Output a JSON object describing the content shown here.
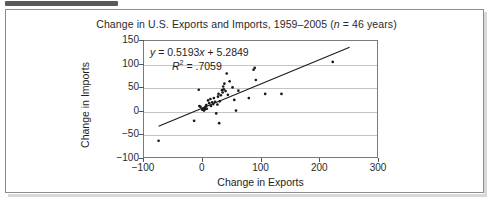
{
  "chart_data": {
    "type": "scatter",
    "title": "Change in U.S. Exports and Imports, 1959–2005 (n = 46 years)",
    "title_plain": "Change in U.S. Exports and Imports, 1959-2005 (n = 46 years)",
    "xlabel": "Change in Exports",
    "ylabel": "Change in Imports",
    "xlim": [
      -100,
      300
    ],
    "ylim": [
      -100,
      150
    ],
    "xticks": [
      -100,
      0,
      100,
      200,
      300
    ],
    "xtick_labels": [
      "−100",
      "0",
      "100",
      "200",
      "300"
    ],
    "yticks": [
      -100,
      -50,
      0,
      50,
      100,
      150
    ],
    "ytick_labels": [
      "−100",
      "−50",
      "0",
      "50",
      "100",
      "150"
    ],
    "grid": "horizontal",
    "legend": "none",
    "annotations": {
      "equation": "y = 0.5193x + 5.2849",
      "equation_slope": 0.5193,
      "equation_intercept": 5.2849,
      "r_squared_label": "R² = .7059",
      "r_squared": 0.7059
    },
    "trendline": {
      "type": "linear",
      "slope": 0.5193,
      "intercept": 5.2849,
      "x_start": -75,
      "x_end": 253
    },
    "points": [
      [
        -75,
        -65
      ],
      [
        -14,
        -22
      ],
      [
        -6,
        45
      ],
      [
        -5,
        10
      ],
      [
        -3,
        8
      ],
      [
        0,
        2
      ],
      [
        2,
        5
      ],
      [
        3,
        0
      ],
      [
        4,
        6
      ],
      [
        5,
        3
      ],
      [
        6,
        9
      ],
      [
        7,
        12
      ],
      [
        8,
        4
      ],
      [
        10,
        22
      ],
      [
        12,
        16
      ],
      [
        14,
        25
      ],
      [
        15,
        10
      ],
      [
        17,
        18
      ],
      [
        19,
        14
      ],
      [
        20,
        27
      ],
      [
        22,
        19
      ],
      [
        24,
        -6
      ],
      [
        26,
        13
      ],
      [
        27,
        30
      ],
      [
        28,
        36
      ],
      [
        29,
        -27
      ],
      [
        30,
        20
      ],
      [
        32,
        33
      ],
      [
        34,
        44
      ],
      [
        35,
        39
      ],
      [
        36,
        52
      ],
      [
        37,
        46
      ],
      [
        38,
        58
      ],
      [
        40,
        42
      ],
      [
        42,
        80
      ],
      [
        44,
        34
      ],
      [
        47,
        63
      ],
      [
        52,
        50
      ],
      [
        55,
        23
      ],
      [
        58,
        0
      ],
      [
        62,
        43
      ],
      [
        80,
        27
      ],
      [
        88,
        88
      ],
      [
        90,
        92
      ],
      [
        92,
        66
      ],
      [
        108,
        36
      ],
      [
        136,
        36
      ],
      [
        224,
        105
      ]
    ]
  },
  "figure": {
    "caption_tab": ""
  }
}
